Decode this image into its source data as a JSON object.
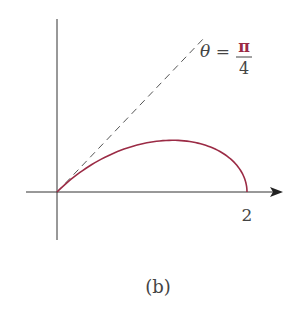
{
  "figure": {
    "caption": "(b)",
    "theta_label": "θ =",
    "pi_num": "π",
    "pi_den": "4",
    "tick_label": "2",
    "curve_color": "#9b2b45"
  },
  "chart_data": {
    "type": "line",
    "title": "",
    "caption": "(b)",
    "series": [
      {
        "name": "r = 2cos(2θ)",
        "x": [
          2.0,
          1.97,
          1.88,
          1.73,
          1.55,
          1.33,
          1.1,
          0.86,
          0.62,
          0.4,
          0.2,
          0.0
        ],
        "y": [
          0.0,
          0.27,
          0.52,
          0.69,
          0.77,
          0.77,
          0.71,
          0.6,
          0.46,
          0.31,
          0.16,
          0.0
        ]
      }
    ],
    "annotations": [
      {
        "type": "dashed-line",
        "label": "θ = π/4",
        "from": [
          0,
          0
        ],
        "to": [
          1.55,
          1.55
        ]
      }
    ],
    "xticks": [
      "2"
    ],
    "xlabel": "",
    "ylabel": "",
    "grid": false,
    "legend": "none"
  }
}
